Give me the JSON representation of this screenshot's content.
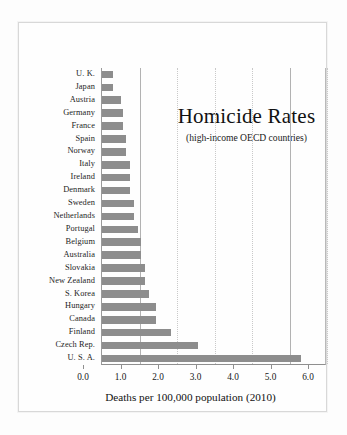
{
  "chart_data": {
    "type": "bar",
    "orientation": "horizontal",
    "title": "Homicide Rates",
    "subtitle": "(high-income OECD countries)",
    "xlabel": "Deaths per 100,000 population (2010)",
    "ylabel": "",
    "xlim": [
      0.0,
      6.0
    ],
    "xticks": [
      "0.0",
      "1.0",
      "2.0",
      "3.0",
      "4.0",
      "5.0",
      "6.0"
    ],
    "xtick_values": [
      0.0,
      1.0,
      2.0,
      3.0,
      4.0,
      5.0,
      6.0
    ],
    "grid": "vertical-dotted",
    "legend": "none",
    "bar_color": "#8d8d8d",
    "categories": [
      "U. K.",
      "Japan",
      "Austria",
      "Germany",
      "France",
      "Spain",
      "Norway",
      "Italy",
      "Ireland",
      "Denmark",
      "Sweden",
      "Netherlands",
      "Portugal",
      "Belgium",
      "Australia",
      "Slovakia",
      "New Zealand",
      "S. Korea",
      "Hungary",
      "Canada",
      "Finland",
      "Czech Rep.",
      "U. S. A."
    ],
    "values": [
      0.3,
      0.3,
      0.5,
      0.55,
      0.55,
      0.65,
      0.65,
      0.75,
      0.75,
      0.75,
      0.85,
      0.85,
      0.95,
      1.05,
      1.05,
      1.15,
      1.15,
      1.25,
      1.45,
      1.45,
      1.85,
      2.55,
      5.3
    ]
  }
}
